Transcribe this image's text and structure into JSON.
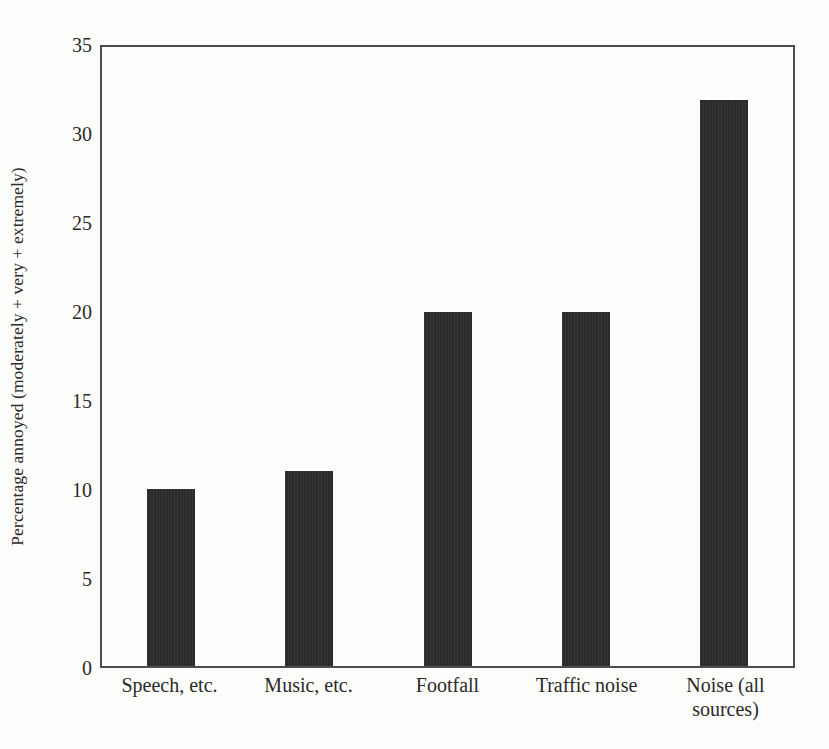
{
  "figure": {
    "background_color": "#fdfdfc",
    "frame_color": "#4d4d4d",
    "bar_color": "#262626"
  },
  "chart_data": {
    "type": "bar",
    "title": "",
    "subtitle": "",
    "xlabel": "",
    "ylabel": "Percentage annoyed (moderately + very + extremely)",
    "categories": [
      "Speech, etc.",
      "Music, etc.",
      "Footfall",
      "Traffic noise",
      "Noise (all sources)"
    ],
    "category_lines": [
      [
        "Speech, etc."
      ],
      [
        "Music, etc."
      ],
      [
        "Footfall"
      ],
      [
        "Traffic noise"
      ],
      [
        "Noise (all",
        "sources)"
      ]
    ],
    "values": [
      10,
      11,
      20,
      20,
      32
    ],
    "ylim": [
      0,
      35
    ],
    "ytick_values": [
      0,
      5,
      10,
      15,
      20,
      25,
      30,
      35
    ],
    "ytick_labels": [
      "0",
      "5",
      "10",
      "15",
      "20",
      "25",
      "30",
      "35"
    ],
    "grid": false,
    "legend": false,
    "legend_position": "none",
    "bar_color": "#262626",
    "orientation": "vertical"
  }
}
